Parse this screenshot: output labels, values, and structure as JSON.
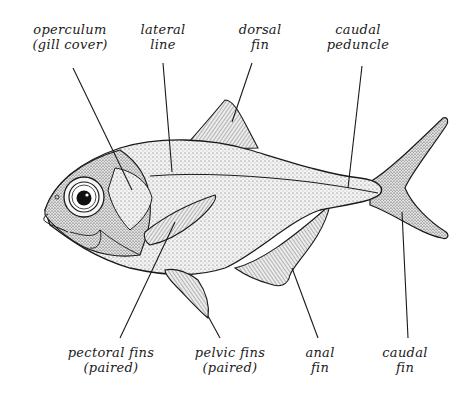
{
  "diagram": {
    "colors": {
      "ink": "#1a1a1a",
      "background": "#ffffff",
      "body_fill": "#ececec",
      "fin_fill": "#d4d4d4"
    },
    "labels": [
      {
        "id": "operculum",
        "line1": "operculum",
        "line2": "(gill cover)",
        "x": 70,
        "y": 22,
        "points_to": [
          105,
          190
        ]
      },
      {
        "id": "lateral-line",
        "line1": "lateral",
        "line2": "line",
        "x": 165,
        "y": 22,
        "points_to": [
          172,
          172
        ]
      },
      {
        "id": "dorsal-fin",
        "line1": "dorsal",
        "line2": "fin",
        "x": 260,
        "y": 22,
        "points_to": [
          232,
          122
        ]
      },
      {
        "id": "caudal-peduncle",
        "line1": "caudal",
        "line2": "peduncle",
        "x": 357,
        "y": 22,
        "points_to": [
          348,
          188
        ]
      },
      {
        "id": "pectoral-fins",
        "line1": "pectoral fins",
        "line2": "(paired)",
        "x": 111,
        "y": 345,
        "points_to": [
          175,
          225
        ]
      },
      {
        "id": "pelvic-fins",
        "line1": "pelvic fins",
        "line2": "(paired)",
        "x": 230,
        "y": 345,
        "points_to": [
          210,
          315
        ]
      },
      {
        "id": "anal-fin",
        "line1": "anal",
        "line2": "fin",
        "x": 320,
        "y": 345,
        "points_to": [
          290,
          270
        ]
      },
      {
        "id": "caudal-fin",
        "line1": "caudal",
        "line2": "fin",
        "x": 405,
        "y": 345,
        "points_to": [
          400,
          210
        ]
      }
    ]
  }
}
